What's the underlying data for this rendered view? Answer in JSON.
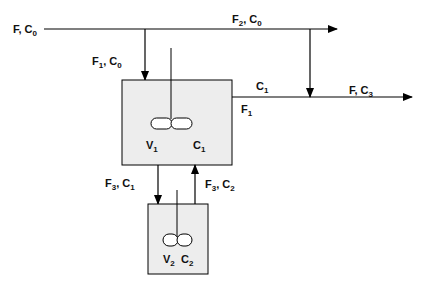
{
  "diagram": {
    "type": "process-flow",
    "colors": {
      "tank_fill": "#ededed",
      "line": "#000000"
    },
    "labels": {
      "feed": {
        "main": "F, C",
        "sub": "0"
      },
      "stream1": {
        "f": "F",
        "f_sub": "1",
        "c": ", C",
        "c_sub": "0"
      },
      "stream2": {
        "f": "F",
        "f_sub": "2",
        "c": ", C",
        "c_sub": "0"
      },
      "tank1_out_c": {
        "c": "C",
        "c_sub": "1"
      },
      "tank1_out_f": {
        "f": "F",
        "f_sub": "1"
      },
      "product": {
        "main": "F, C",
        "sub": "3"
      },
      "tank1_v": {
        "v": "V",
        "v_sub": "1"
      },
      "tank1_c": {
        "c": "C",
        "c_sub": "1"
      },
      "down_stream": {
        "f": "F",
        "f_sub": "3",
        "c": ", C",
        "c_sub": "1"
      },
      "up_stream": {
        "f": "F",
        "f_sub": "3",
        "c": ", C",
        "c_sub": "2"
      },
      "tank2_v": {
        "v": "V",
        "v_sub": "2"
      },
      "tank2_c": {
        "c": "C",
        "c_sub": "2"
      }
    }
  }
}
